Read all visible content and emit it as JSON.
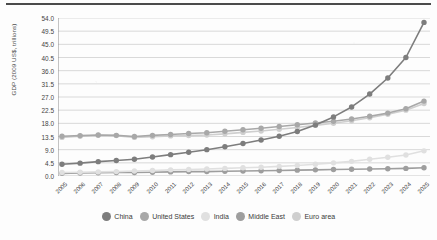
{
  "chart_data": {
    "type": "line",
    "title": "",
    "xlabel": "",
    "ylabel": "GDP (2009 US$, trillions)",
    "categories": [
      "2005",
      "2006",
      "2007",
      "2008",
      "2009",
      "2010",
      "2011",
      "2012",
      "2013",
      "2014",
      "2015",
      "2016",
      "2017",
      "2018",
      "2019",
      "2020",
      "2021",
      "2022",
      "2023",
      "2024",
      "2025"
    ],
    "x": [
      2005,
      2006,
      2007,
      2008,
      2009,
      2010,
      2011,
      2012,
      2013,
      2014,
      2015,
      2016,
      2017,
      2018,
      2019,
      2020,
      2021,
      2022,
      2023,
      2024,
      2025
    ],
    "ylim": [
      0,
      54
    ],
    "xlim": [
      2005,
      2025
    ],
    "yticks": [
      "0.0",
      "4.5",
      "9.0",
      "13.5",
      "18.0",
      "22.5",
      "27.0",
      "31.5",
      "36.0",
      "40.5",
      "45.0",
      "49.5",
      "54.0"
    ],
    "ytick_values": [
      0,
      4.5,
      9.0,
      13.5,
      18.0,
      22.5,
      27.0,
      31.5,
      36.0,
      40.5,
      45.0,
      49.5,
      54.0
    ],
    "grid": true,
    "legend_position": "bottom",
    "markers": "circle",
    "series": [
      {
        "name": "China",
        "color": "#7d7d7d",
        "values": [
          4.0,
          4.4,
          4.9,
          5.3,
          5.7,
          6.5,
          7.3,
          8.1,
          9.0,
          10.0,
          11.1,
          12.3,
          13.6,
          15.2,
          17.4,
          20.2,
          23.6,
          28.0,
          33.5,
          40.5,
          52.5
        ]
      },
      {
        "name": "United States",
        "color": "#a8a8a8",
        "values": [
          13.6,
          13.8,
          14.0,
          13.9,
          13.5,
          13.9,
          14.2,
          14.5,
          14.8,
          15.3,
          15.8,
          16.3,
          16.9,
          17.5,
          18.1,
          18.7,
          19.5,
          20.4,
          21.5,
          23.0,
          25.6
        ]
      },
      {
        "name": "India",
        "color": "#e0e0e0",
        "values": [
          1.2,
          1.3,
          1.4,
          1.5,
          1.7,
          1.9,
          2.1,
          2.2,
          2.4,
          2.6,
          2.8,
          3.0,
          3.3,
          3.6,
          4.0,
          4.5,
          5.0,
          5.7,
          6.4,
          7.2,
          8.6
        ]
      },
      {
        "name": "Middle East",
        "color": "#9e9e9e",
        "values": [
          0.9,
          1.0,
          1.1,
          1.2,
          1.2,
          1.3,
          1.4,
          1.5,
          1.5,
          1.6,
          1.7,
          1.8,
          1.9,
          2.0,
          2.1,
          2.2,
          2.3,
          2.4,
          2.5,
          2.6,
          2.8
        ]
      },
      {
        "name": "Euro area",
        "color": "#cfcfcf",
        "values": [
          13.2,
          13.6,
          13.9,
          13.8,
          13.2,
          13.4,
          13.7,
          13.8,
          14.0,
          14.4,
          14.9,
          15.4,
          16.0,
          16.6,
          17.3,
          18.0,
          18.9,
          19.9,
          21.1,
          22.5,
          24.8
        ]
      }
    ]
  },
  "legend": {
    "items": [
      {
        "label": "China"
      },
      {
        "label": "United States"
      },
      {
        "label": "India"
      },
      {
        "label": "Middle East"
      },
      {
        "label": "Euro area"
      }
    ]
  }
}
